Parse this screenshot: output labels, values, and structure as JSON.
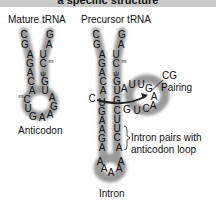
{
  "banner": {
    "title": "a specific structure"
  },
  "labels": {
    "mature": "Mature tRNA",
    "precursor": "Precursor tRNA",
    "anticodon": "Anticodon",
    "cg_pairing_line1": "CG",
    "cg_pairing_line2": "Pairing",
    "intron_pairs_line1": "Intron pairs with",
    "intron_pairs_line2": "anticodon loop",
    "intron": "Intron"
  },
  "mature_trna": {
    "left_strand": [
      "C",
      "G",
      "A",
      "G",
      "A",
      "C",
      "A",
      "mC",
      "U"
    ],
    "right_strand": [
      "G",
      "A",
      "U",
      "Cm",
      "ψ",
      "G",
      "U",
      "A"
    ],
    "loop": [
      "G",
      "A",
      "A",
      "G",
      "A"
    ]
  },
  "precursor_trna": {
    "left_strand": [
      "C",
      "G",
      "A",
      "G",
      "A",
      "C",
      "A",
      "C",
      "U",
      "G",
      "A",
      "A",
      "G",
      "A",
      "A"
    ],
    "right_strand": [
      "G",
      "A",
      "U",
      "Cm",
      "ψ",
      "G",
      "U",
      "G",
      "C",
      "U",
      "U",
      "C",
      "A",
      "A"
    ],
    "intron_loop": [
      "A",
      "U",
      "U",
      "G",
      "A",
      "A",
      "C",
      "U",
      "G"
    ],
    "bottom_loop": [
      "A",
      "A",
      "A"
    ]
  },
  "colors": {
    "banner": "#c9c9c9",
    "shade": "#9a9a9a",
    "text": "#111111",
    "arrow": "#222222"
  }
}
